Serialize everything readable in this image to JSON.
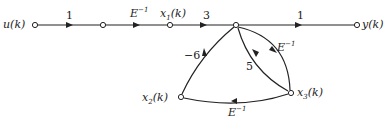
{
  "diagram": {
    "type": "signal-flow-graph",
    "nodes": [
      {
        "id": "u",
        "label": "u(k)",
        "x": 35,
        "y": 25
      },
      {
        "id": "n1",
        "label": "",
        "x": 103,
        "y": 25
      },
      {
        "id": "x1",
        "label_base": "x",
        "label_sub": "1",
        "label_tail": "(k)",
        "x": 170,
        "y": 25
      },
      {
        "id": "n2",
        "label": "",
        "x": 236,
        "y": 25
      },
      {
        "id": "y",
        "label": "y(k)",
        "x": 357,
        "y": 25
      },
      {
        "id": "x2",
        "label_base": "x",
        "label_sub": "2",
        "label_tail": "(k)",
        "x": 181,
        "y": 97
      },
      {
        "id": "x3",
        "label_base": "x",
        "label_sub": "3",
        "label_tail": "(k)",
        "x": 291,
        "y": 93
      }
    ],
    "edges": [
      {
        "from": "u",
        "to": "n1",
        "gain": "1"
      },
      {
        "from": "n1",
        "to": "x1",
        "gain_base": "E",
        "gain_exp": "−1"
      },
      {
        "from": "x1",
        "to": "n2",
        "gain": "3"
      },
      {
        "from": "n2",
        "to": "y",
        "gain": "1"
      },
      {
        "from": "n2",
        "to": "x3",
        "gain_base": "E",
        "gain_exp": "−1"
      },
      {
        "from": "x3",
        "to": "n2",
        "gain": "5"
      },
      {
        "from": "x3",
        "to": "x2",
        "gain_base": "E",
        "gain_exp": "−1"
      },
      {
        "from": "x2",
        "to": "n2",
        "gain": "−6"
      }
    ]
  }
}
